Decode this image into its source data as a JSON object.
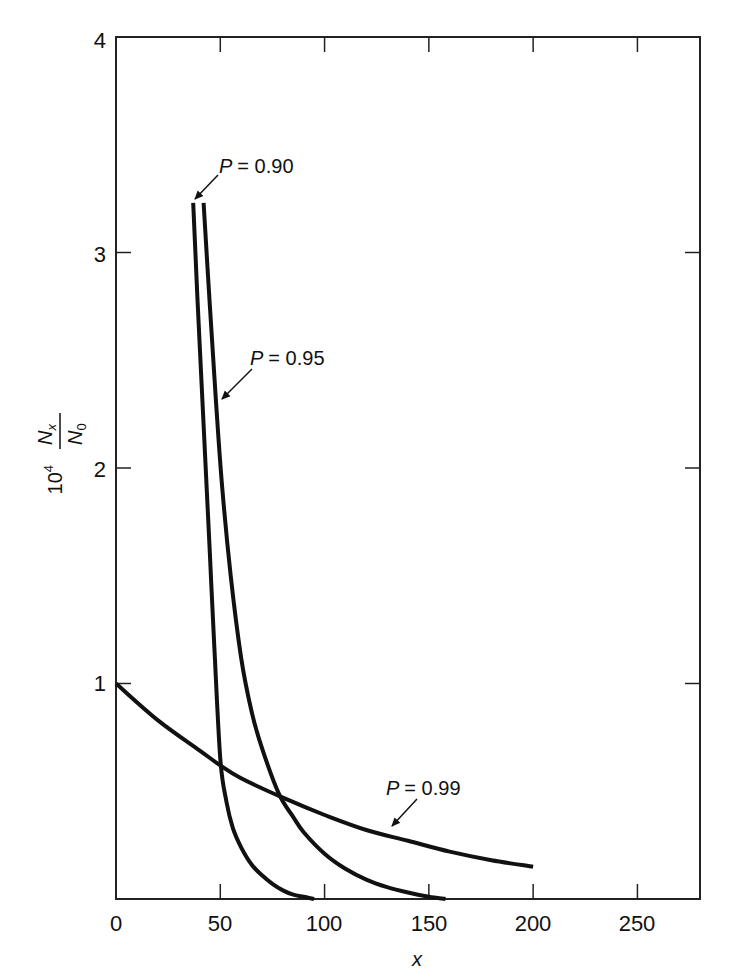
{
  "chart_data": {
    "type": "line",
    "title": "",
    "xlabel": "x",
    "ylabel": "10^4 Nx/N0",
    "ylabel_parts": {
      "prefix": "10",
      "exponent": "4",
      "numerator": "N",
      "numerator_sub": "x",
      "denominator": "N",
      "denominator_sub": "0"
    },
    "xlim": [
      0,
      280
    ],
    "ylim": [
      0,
      4
    ],
    "xticks": [
      0,
      50,
      100,
      150,
      200,
      250
    ],
    "yticks": [
      1,
      2,
      3,
      4
    ],
    "xtick_labels": [
      "0",
      "50",
      "100",
      "150",
      "200",
      "250"
    ],
    "ytick_labels": [
      "1",
      "2",
      "3",
      "4"
    ],
    "grid": false,
    "legend": "inline annotations with arrows",
    "series": [
      {
        "name": "P = 0.90",
        "x": [
          37,
          39,
          41,
          43,
          45,
          47,
          50,
          53,
          56,
          60,
          65,
          70,
          75,
          80,
          85,
          90,
          95
        ],
        "y": [
          3.23,
          2.8,
          2.4,
          2.0,
          1.6,
          1.2,
          0.65,
          0.45,
          0.33,
          0.24,
          0.16,
          0.11,
          0.07,
          0.04,
          0.02,
          0.01,
          0.0
        ]
      },
      {
        "name": "P = 0.95",
        "x": [
          42,
          45,
          48,
          51,
          55,
          60,
          65,
          70,
          78,
          85,
          90,
          100,
          110,
          120,
          130,
          140,
          150,
          158
        ],
        "y": [
          3.23,
          2.75,
          2.3,
          1.9,
          1.5,
          1.12,
          0.87,
          0.7,
          0.49,
          0.38,
          0.31,
          0.21,
          0.14,
          0.09,
          0.055,
          0.03,
          0.01,
          0.0
        ]
      },
      {
        "name": "P = 0.99",
        "x": [
          0,
          20,
          40,
          50,
          60,
          80,
          100,
          120,
          140,
          160,
          180,
          200
        ],
        "y": [
          1.0,
          0.83,
          0.69,
          0.62,
          0.56,
          0.47,
          0.39,
          0.32,
          0.27,
          0.22,
          0.18,
          0.15
        ]
      }
    ],
    "annotations": [
      {
        "text": "P = 0.90",
        "label_var": "P",
        "label_value": "= 0.90",
        "points_to_series": "P = 0.90"
      },
      {
        "text": "P = 0.95",
        "label_var": "P",
        "label_value": "= 0.95",
        "points_to_series": "P = 0.95"
      },
      {
        "text": "P = 0.99",
        "label_var": "P",
        "label_value": "= 0.99",
        "points_to_series": "P = 0.99"
      }
    ]
  },
  "ui": {
    "xlabel": "x",
    "ylabel_prefix": "10",
    "ylabel_exp": "4",
    "ylabel_num": "N",
    "ylabel_num_sub": "x",
    "ylabel_den": "N",
    "ylabel_den_sub": "0",
    "ann": [
      {
        "var": "P",
        "val": "= 0.90"
      },
      {
        "var": "P",
        "val": "= 0.95"
      },
      {
        "var": "P",
        "val": "= 0.99"
      }
    ],
    "xticks": [
      "0",
      "50",
      "100",
      "150",
      "200",
      "250"
    ],
    "yticks": [
      "1",
      "2",
      "3",
      "4"
    ],
    "colors": {
      "line": "#111111",
      "frame": "#222222",
      "background": "#ffffff"
    }
  }
}
